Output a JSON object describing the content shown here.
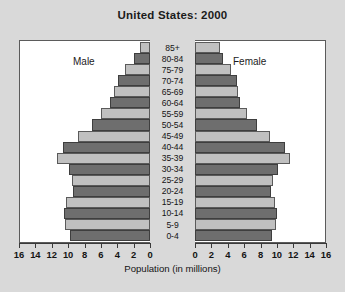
{
  "title": "United States: 2000",
  "labels": {
    "male": "Male",
    "female": "Female",
    "axis_title": "Population (in millions)"
  },
  "axis": {
    "ticks": [
      0,
      2,
      4,
      6,
      8,
      10,
      12,
      14,
      16
    ],
    "max": 16,
    "left_tick_labels": [
      "16",
      "14",
      "12",
      "10",
      "8",
      "6",
      "4",
      "2",
      "0"
    ],
    "right_tick_labels": [
      "0",
      "2",
      "4",
      "6",
      "8",
      "10",
      "12",
      "14",
      "16"
    ]
  },
  "colors": {
    "page_background": "#d9d9d9",
    "plot_background": "#ffffff",
    "bar_dark": "#6e6e6e",
    "bar_light": "#c0c0c0",
    "frame": "#5b5b5b",
    "text": "#141414"
  },
  "chart_data": {
    "type": "bar",
    "title": "United States: 2000",
    "subtitle": "",
    "xlabel": "Population (in millions)",
    "ylabel": "",
    "xlim": [
      0,
      16
    ],
    "grid": false,
    "legend_position": "inline",
    "orientation": "horizontal",
    "style": "population-pyramid",
    "categories": [
      "85+",
      "80-84",
      "75-79",
      "70-74",
      "65-69",
      "60-64",
      "55-59",
      "50-54",
      "45-49",
      "40-44",
      "35-39",
      "30-34",
      "25-29",
      "20-24",
      "15-19",
      "10-14",
      "5-9",
      "0-4"
    ],
    "series": [
      {
        "name": "Male",
        "side": "left",
        "values": [
          1.2,
          2.0,
          3.0,
          3.9,
          4.4,
          4.9,
          6.0,
          7.1,
          8.8,
          10.6,
          11.4,
          9.9,
          9.5,
          9.4,
          10.3,
          10.5,
          10.4,
          9.8
        ]
      },
      {
        "name": "Female",
        "side": "right",
        "values": [
          3.0,
          3.4,
          4.4,
          5.1,
          5.2,
          5.5,
          6.4,
          7.6,
          9.1,
          11.0,
          11.6,
          10.1,
          9.5,
          9.3,
          9.8,
          10.0,
          9.9,
          9.4
        ]
      }
    ],
    "bar_shades": [
      "light",
      "dark",
      "light",
      "dark",
      "light",
      "dark",
      "light",
      "dark",
      "light",
      "dark",
      "light",
      "dark",
      "light",
      "dark",
      "light",
      "dark",
      "light",
      "dark"
    ]
  }
}
